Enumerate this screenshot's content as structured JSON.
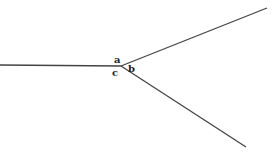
{
  "diagram": {
    "type": "angle-diagram",
    "vertex": {
      "x": 121,
      "y": 66
    },
    "rays": [
      {
        "name": "left-ray",
        "x2": 0,
        "y2": 65
      },
      {
        "name": "upper-right-ray",
        "x2": 267,
        "y2": 8
      },
      {
        "name": "lower-right-ray",
        "x2": 246,
        "y2": 147
      }
    ],
    "labels": {
      "a": "a",
      "b": "b",
      "c": "c"
    },
    "colors": {
      "line": "#444444",
      "text": "#222222",
      "background": "#ffffff"
    }
  }
}
